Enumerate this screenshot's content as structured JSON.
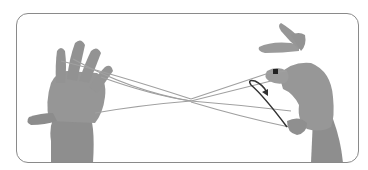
{
  "figure": {
    "elements": [
      "left-hand",
      "right-hand",
      "string-loops",
      "motion-arrow"
    ],
    "colors": {
      "border": "#8a8a8a",
      "skin": "#9a9a9a",
      "skin_dark": "#7a7a7a",
      "string": "#a0a0a0",
      "arrow": "#333333",
      "background": "#ffffff"
    }
  }
}
